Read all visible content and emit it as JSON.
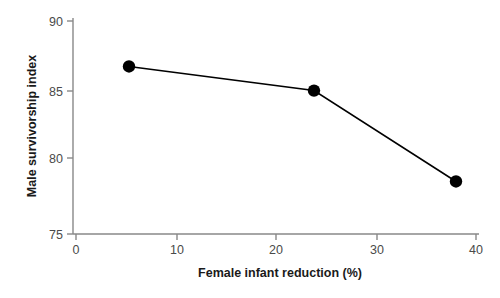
{
  "chart_data": {
    "type": "line",
    "title": "",
    "xlabel": "Female infant reduction (%)",
    "ylabel": "Male survivorship index",
    "xlim": [
      0,
      40
    ],
    "ylim": [
      75,
      90
    ],
    "xticks": [
      0,
      10,
      20,
      30,
      40
    ],
    "yticks": [
      75,
      80,
      85,
      90
    ],
    "xtick_labels": [
      "0",
      "10",
      "20",
      "30",
      "40"
    ],
    "ytick_labels": [
      "75",
      "80",
      "85",
      "90"
    ],
    "grid": false,
    "legend": false,
    "marker": "circle-filled",
    "marker_color": "#000000",
    "line_color": "#000000",
    "axis_color": "#888888",
    "background": "#ffffff",
    "x": [
      5.3,
      23.8,
      38.0
    ],
    "values": [
      86.8,
      85.1,
      78.7
    ],
    "points": [
      {
        "x": 5.3,
        "y": 86.8
      },
      {
        "x": 23.8,
        "y": 85.1
      },
      {
        "x": 38.0,
        "y": 78.7
      }
    ],
    "series": [
      {
        "name": "Male survivorship index",
        "x": [
          5.3,
          23.8,
          38.0
        ],
        "values": [
          86.8,
          85.1,
          78.7
        ]
      }
    ]
  },
  "axes": {
    "x_title": "Female infant reduction (%)",
    "y_title": "Male survivorship index",
    "x_ticks": [
      {
        "label": "0",
        "value": 0
      },
      {
        "label": "10",
        "value": 10
      },
      {
        "label": "20",
        "value": 20
      },
      {
        "label": "30",
        "value": 30
      },
      {
        "label": "40",
        "value": 40
      }
    ],
    "y_ticks": [
      {
        "label": "90",
        "value": 90
      },
      {
        "label": "85",
        "value": 85
      },
      {
        "label": "80",
        "value": 80
      },
      {
        "label": "75",
        "value": 75
      }
    ]
  }
}
